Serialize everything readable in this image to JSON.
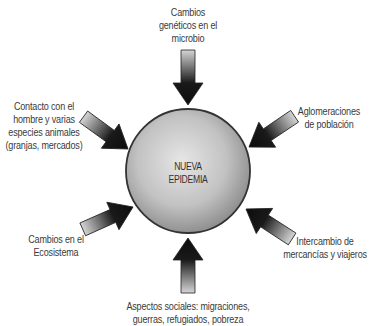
{
  "diagram": {
    "center": {
      "line1": "NUEVA",
      "line2": "EPIDEMIA"
    },
    "factors": [
      {
        "id": "top",
        "lines": [
          "Cambios",
          "genéticos en el",
          "microbio"
        ]
      },
      {
        "id": "upper-left",
        "lines": [
          "Contacto con el",
          "hombre y varias",
          "especies animales",
          "(granjas, mercados)"
        ]
      },
      {
        "id": "upper-right",
        "lines": [
          "Aglomeraciones",
          "de población"
        ]
      },
      {
        "id": "lower-left",
        "lines": [
          "Cambios en el",
          "Ecosistema"
        ]
      },
      {
        "id": "lower-right",
        "lines": [
          "Intercambio de",
          "mercancías y viajeros"
        ]
      },
      {
        "id": "bottom",
        "lines": [
          "Aspectos sociales: migraciones,",
          "guerras, refugiados, pobreza"
        ]
      }
    ],
    "colors": {
      "circle_light": "#e4e4e4",
      "circle_dark": "#8a8a8a",
      "arrow_dark": "#111111",
      "arrow_light": "#d8d8d8"
    }
  }
}
